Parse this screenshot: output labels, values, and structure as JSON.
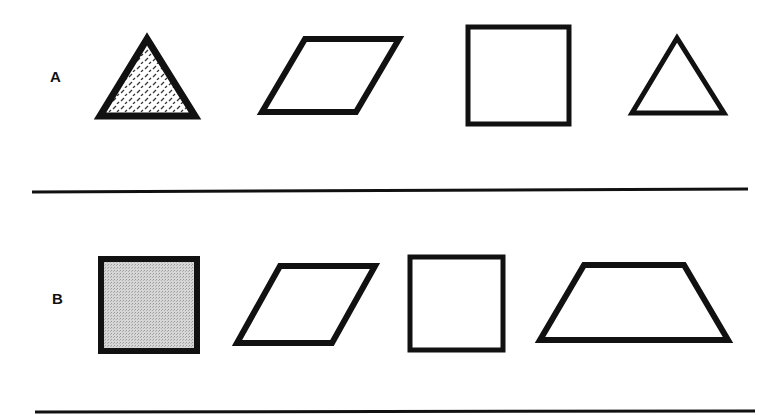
{
  "rows": [
    {
      "label": "A",
      "shapes": [
        {
          "type": "triangle",
          "fill": "diamond-plate-pattern"
        },
        {
          "type": "parallelogram",
          "fill": "none"
        },
        {
          "type": "square",
          "fill": "none"
        },
        {
          "type": "triangle",
          "fill": "none"
        }
      ]
    },
    {
      "label": "B",
      "shapes": [
        {
          "type": "square",
          "fill": "gray-dot-pattern"
        },
        {
          "type": "parallelogram",
          "fill": "none"
        },
        {
          "type": "square",
          "fill": "none"
        },
        {
          "type": "trapezoid",
          "fill": "none"
        }
      ]
    }
  ],
  "colors": {
    "stroke": "#111111",
    "background": "#ffffff",
    "gray_fill": "#c8c8c8"
  }
}
